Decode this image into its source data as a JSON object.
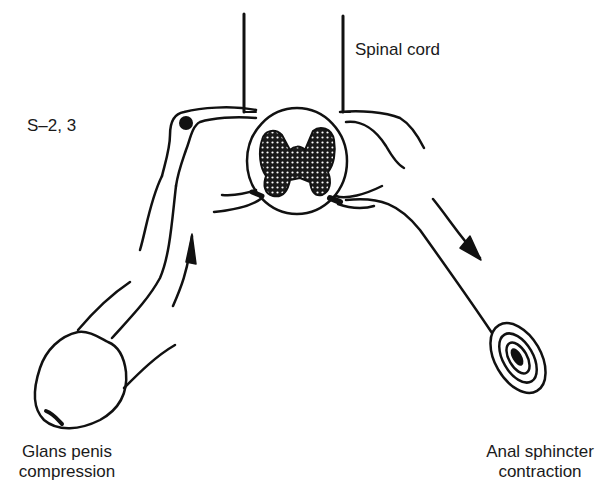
{
  "diagram": {
    "type": "reflex-arc",
    "labels": {
      "spinal_cord": "Spinal cord",
      "segment": "S–2, 3",
      "afferent_origin_line1": "Glans penis",
      "afferent_origin_line2": "compression",
      "efferent_target_line1": "Anal sphincter",
      "efferent_target_line2": "contraction"
    },
    "components": [
      {
        "id": "spinal-cord-section",
        "description": "cross-section with stippled H-shaped gray matter"
      },
      {
        "id": "dorsal-root-ganglion",
        "description": "filled dot at S-2,3 on left root"
      },
      {
        "id": "afferent-pathway",
        "description": "from glans penis up to spinal cord",
        "arrow_direction": "up"
      },
      {
        "id": "efferent-pathway",
        "description": "from spinal cord down to anal sphincter",
        "arrow_direction": "down-right"
      },
      {
        "id": "glans-penis",
        "description": "rounded glans at bottom-left"
      },
      {
        "id": "anal-sphincter",
        "description": "concentric oval rings at bottom-right"
      }
    ],
    "colors": {
      "ink": "#111111",
      "background": "#ffffff",
      "stipple": "#2a2a2a"
    }
  }
}
